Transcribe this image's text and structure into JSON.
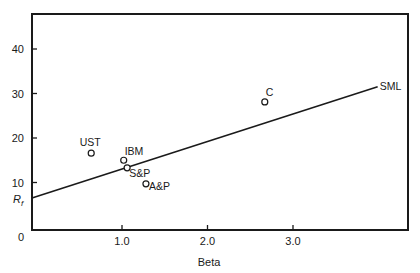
{
  "chart_data": {
    "type": "scatter",
    "title": "",
    "xlabel": "Beta",
    "ylabel": "R_f",
    "ylabel_main": "R",
    "ylabel_sub": "f",
    "xlim": [
      0,
      4.3
    ],
    "ylim": [
      0,
      48
    ],
    "x_ticks": [
      {
        "value": 1.0,
        "label": "1.0"
      },
      {
        "value": 2.0,
        "label": "2.0"
      },
      {
        "value": 3.0,
        "label": "3.0"
      }
    ],
    "y_ticks": [
      {
        "value": 0,
        "label": "0"
      },
      {
        "value": 10,
        "label": "10"
      },
      {
        "value": 20,
        "label": "20"
      },
      {
        "value": 30,
        "label": "30"
      },
      {
        "value": 40,
        "label": "40"
      }
    ],
    "grid": false,
    "legend": "none",
    "points": [
      {
        "label": "UST",
        "x": 0.64,
        "y": 16.6,
        "label_pos": "above"
      },
      {
        "label": "IBM",
        "x": 1.02,
        "y": 15.0,
        "label_pos": "above-right"
      },
      {
        "label": "S&P",
        "x": 1.06,
        "y": 13.3,
        "label_pos": "below-right"
      },
      {
        "label": "A&P",
        "x": 1.28,
        "y": 9.7,
        "label_pos": "right-low"
      },
      {
        "label": "C",
        "x": 2.67,
        "y": 28.1,
        "label_pos": "above-right"
      }
    ],
    "lines": [
      {
        "name": "SML",
        "label": "SML",
        "x": [
          0,
          3.99
        ],
        "y": [
          6.5,
          31.5
        ],
        "intercept": 6.5,
        "slope": 6.27
      }
    ],
    "annotations": [
      {
        "text": "SML",
        "at": "end of line"
      },
      {
        "text": "R_f",
        "at": "y-intercept of SML"
      }
    ]
  },
  "colors": {
    "ink": "#1a1a1a",
    "background": "#ffffff"
  }
}
